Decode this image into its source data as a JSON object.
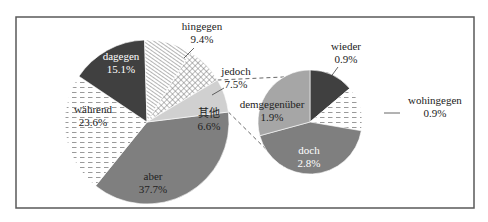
{
  "chart_data": {
    "type": "pie",
    "title": "",
    "subtitle": "",
    "main_pie": {
      "slices": [
        {
          "label": "aber",
          "value": 37.7,
          "display": "37.7%",
          "fill": "#7f7f7f",
          "pattern": "solid",
          "text_color": "#222222"
        },
        {
          "label": "während",
          "value": 23.6,
          "display": "23.6%",
          "fill": "#ffffff",
          "pattern": "dashes",
          "text_color": "#222222"
        },
        {
          "label": "dagegen",
          "value": 15.1,
          "display": "15.1%",
          "fill": "#404040",
          "pattern": "solid",
          "text_color": "#ffffff"
        },
        {
          "label": "hingegen",
          "value": 9.4,
          "display": "9.4%",
          "fill": "#ffffff",
          "pattern": "diagonal",
          "text_color": "#222222"
        },
        {
          "label": "jedoch",
          "value": 7.5,
          "display": "7.5%",
          "fill": "#ffffff",
          "pattern": "crosshatch",
          "text_color": "#222222"
        },
        {
          "label": "其他",
          "value": 6.6,
          "display": "6.6%",
          "fill": "#d0d0d0",
          "pattern": "solid",
          "text_color": "#222222"
        }
      ]
    },
    "breakdown_pie": {
      "parent": "其他",
      "slices": [
        {
          "label": "wieder",
          "value": 0.9,
          "display": "0.9%",
          "fill": "#404040",
          "pattern": "solid",
          "text_color": "#222222"
        },
        {
          "label": "wohingegen",
          "value": 0.9,
          "display": "0.9%",
          "fill": "#ffffff",
          "pattern": "dashes",
          "text_color": "#222222"
        },
        {
          "label": "doch",
          "value": 2.8,
          "display": "2.8%",
          "fill": "#7f7f7f",
          "pattern": "solid",
          "text_color": "#ffffff"
        },
        {
          "label": "demgegenüber",
          "value": 1.9,
          "display": "1.9%",
          "fill": "#a6a6a6",
          "pattern": "solid",
          "text_color": "#222222"
        }
      ]
    },
    "legend": "none",
    "frame_color": "#595959",
    "connector_style": "dashed"
  }
}
